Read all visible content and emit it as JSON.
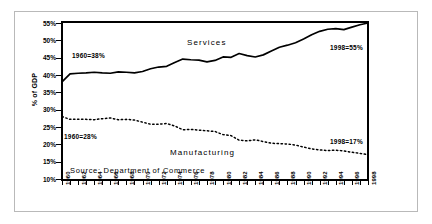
{
  "chart_data": {
    "type": "line",
    "title": "",
    "xlabel": "",
    "ylabel": "% of GDP",
    "ylim": [
      10,
      55
    ],
    "ytick_labels": [
      "55%",
      "50%",
      "45%",
      "40%",
      "35%",
      "30%",
      "25%",
      "20%",
      "15%",
      "10%"
    ],
    "ytick_values": [
      55,
      50,
      45,
      40,
      35,
      30,
      25,
      20,
      15,
      10
    ],
    "grid": false,
    "legend_position": "inline-labels",
    "xlim": [
      1960,
      1998
    ],
    "x": [
      1960,
      1961,
      1962,
      1963,
      1964,
      1965,
      1966,
      1967,
      1968,
      1969,
      1970,
      1971,
      1972,
      1973,
      1974,
      1975,
      1976,
      1977,
      1978,
      1979,
      1980,
      1981,
      1982,
      1983,
      1984,
      1985,
      1986,
      1987,
      1988,
      1989,
      1990,
      1991,
      1992,
      1993,
      1994,
      1995,
      1996,
      1997,
      1998
    ],
    "xtick_labels": [
      "1960",
      "1962",
      "1964",
      "1966",
      "1968",
      "1970",
      "1972",
      "1974",
      "1976",
      "1978",
      "1980",
      "1982",
      "1984",
      "1986",
      "1988",
      "1990",
      "1992",
      "1994",
      "1996",
      "1998"
    ],
    "series": [
      {
        "name": "Services",
        "style": "solid",
        "color": "#000000",
        "values": [
          38.0,
          40.3,
          40.5,
          40.6,
          40.8,
          40.6,
          40.5,
          40.9,
          40.8,
          40.6,
          41.0,
          41.8,
          42.3,
          42.5,
          43.6,
          44.6,
          44.4,
          44.3,
          43.8,
          44.2,
          45.2,
          45.1,
          46.2,
          45.6,
          45.2,
          45.8,
          46.9,
          48.0,
          48.6,
          49.3,
          50.4,
          51.6,
          52.6,
          53.2,
          53.4,
          53.1,
          53.8,
          54.5,
          55.0
        ]
      },
      {
        "name": "Manufacturing",
        "style": "dotted",
        "color": "#000000",
        "values": [
          28.0,
          27.2,
          27.2,
          27.2,
          27.1,
          27.4,
          27.6,
          27.1,
          27.2,
          27.0,
          26.4,
          25.8,
          25.8,
          26.0,
          25.3,
          24.2,
          24.3,
          24.1,
          23.9,
          23.7,
          22.8,
          22.5,
          21.2,
          21.0,
          21.3,
          20.8,
          20.3,
          20.2,
          20.1,
          19.8,
          19.2,
          18.7,
          18.4,
          18.2,
          18.3,
          18.1,
          17.7,
          17.4,
          17.0
        ]
      }
    ],
    "annotations": [
      {
        "id": "services-start",
        "text": "1960=38%",
        "x_px": 72,
        "y_px": 52
      },
      {
        "id": "services-end",
        "text": "1998=55%",
        "x_px": 330,
        "y_px": 44
      },
      {
        "id": "manufacturing-start",
        "text": "1960=28%",
        "x_px": 64,
        "y_px": 133
      },
      {
        "id": "manufacturing-end",
        "text": "1998=17%",
        "x_px": 330,
        "y_px": 138
      },
      {
        "id": "services-series-label",
        "text": "Services",
        "x_px": 187,
        "y_px": 38
      },
      {
        "id": "manufacturing-series-label",
        "text": "Manufacturing",
        "x_px": 170,
        "y_px": 148
      }
    ],
    "source_note": "Source: Department of Commerce"
  }
}
